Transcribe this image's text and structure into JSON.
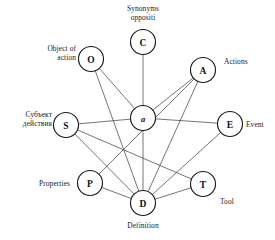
{
  "diagram": {
    "canvas": {
      "width": 275,
      "height": 240
    },
    "nodes": [
      {
        "id": "C",
        "letter": "C",
        "cx": 143,
        "cy": 42,
        "r": 12.5,
        "style": "upright"
      },
      {
        "id": "O",
        "letter": "O",
        "cx": 91,
        "cy": 59,
        "r": 12.5,
        "style": "upright"
      },
      {
        "id": "A",
        "letter": "A",
        "cx": 203,
        "cy": 70,
        "r": 12.5,
        "style": "upright"
      },
      {
        "id": "W",
        "letter": "a",
        "cx": 143,
        "cy": 118,
        "r": 12.5,
        "style": "italic"
      },
      {
        "id": "S",
        "letter": "S",
        "cx": 66,
        "cy": 125,
        "r": 12.5,
        "style": "upright"
      },
      {
        "id": "E",
        "letter": "E",
        "cx": 230,
        "cy": 124,
        "r": 12.5,
        "style": "upright"
      },
      {
        "id": "P",
        "letter": "P",
        "cx": 90,
        "cy": 183,
        "r": 12.5,
        "style": "upright"
      },
      {
        "id": "T",
        "letter": "T",
        "cx": 203,
        "cy": 184,
        "r": 12.5,
        "style": "upright"
      },
      {
        "id": "D",
        "letter": "D",
        "cx": 143,
        "cy": 203,
        "r": 12.5,
        "style": "upright"
      }
    ],
    "edges": [
      {
        "from": "C",
        "to": "W"
      },
      {
        "from": "O",
        "to": "W"
      },
      {
        "from": "A",
        "to": "W"
      },
      {
        "from": "S",
        "to": "W"
      },
      {
        "from": "E",
        "to": "W"
      },
      {
        "from": "W",
        "to": "D"
      },
      {
        "from": "O",
        "to": "D"
      },
      {
        "from": "A",
        "to": "D"
      },
      {
        "from": "S",
        "to": "D"
      },
      {
        "from": "E",
        "to": "D"
      },
      {
        "from": "P",
        "to": "D"
      },
      {
        "from": "T",
        "to": "D"
      },
      {
        "from": "A",
        "to": "P"
      },
      {
        "from": "S",
        "to": "T"
      }
    ],
    "labels": [
      {
        "id": "label-C",
        "for": "C",
        "text": "Synonyms\noppositi",
        "x": 112,
        "y": 4,
        "w": 62,
        "align": "center"
      },
      {
        "id": "label-O",
        "for": "O",
        "text": "Object of\naction",
        "x": 22,
        "y": 44,
        "w": 54,
        "align": "right"
      },
      {
        "id": "label-A",
        "for": "A",
        "text": "Actions",
        "x": 224,
        "y": 57,
        "w": 48,
        "align": "left"
      },
      {
        "id": "label-S",
        "for": "S",
        "text": "Субъект\nдействия",
        "x": 2,
        "y": 110,
        "w": 50,
        "align": "right"
      },
      {
        "id": "label-E",
        "for": "E",
        "text": "Event",
        "x": 246,
        "y": 120,
        "w": 28,
        "align": "left"
      },
      {
        "id": "label-P",
        "for": "P",
        "text": "Properties",
        "x": 18,
        "y": 179,
        "w": 52,
        "align": "right"
      },
      {
        "id": "label-T",
        "for": "T",
        "text": "Tool",
        "x": 220,
        "y": 197,
        "w": 28,
        "align": "left"
      },
      {
        "id": "label-D",
        "for": "D",
        "text": "Definition",
        "x": 113,
        "y": 221,
        "w": 60,
        "align": "center"
      }
    ],
    "colors": {
      "background": "#ffffff",
      "node_stroke": "#1a1a1a",
      "node_fill": "#ffffff",
      "edge_stroke": "#3a3a3a",
      "text": "#1a1a1a"
    }
  }
}
